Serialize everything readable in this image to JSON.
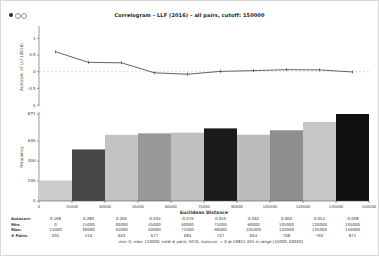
{
  "window": {
    "title": "Correlogram – LLF (2016) – all pairs, cutoff: 150000",
    "controls": {
      "close": "close-dot",
      "minimize": "minimize-dot",
      "zoom": "zoom-dot"
    }
  },
  "chart_data": [
    {
      "type": "line",
      "name": "autocorrelation-by-distance",
      "ylabel": "Autocorr. of LLF (2016)",
      "x": [
        7500,
        22500,
        37500,
        52500,
        67500,
        82500,
        97500,
        112500,
        127500,
        142500
      ],
      "values": [
        0.598,
        0.28,
        0.266,
        -0.034,
        -0.076,
        0.01,
        0.032,
        0.06,
        0.054,
        -0.008
      ],
      "yticks": [
        "1",
        "0.5",
        "0",
        "-0.5",
        "-1"
      ],
      "ytick_values": [
        1,
        0.5,
        0,
        -0.5,
        -1
      ],
      "ylim": [
        -1,
        1
      ],
      "zero_line": "dashed",
      "line_color": "#3a3a3a",
      "zero_line_color": "#c8c8c8"
    },
    {
      "type": "bar",
      "name": "pair-frequency-histogram",
      "ylabel": "Frequency",
      "xlabel": "Euclidean Distance",
      "categories": [
        "0-15000",
        "15000-30000",
        "30000-45000",
        "45000-60000",
        "60000-75000",
        "75000-90000",
        "90000-105000",
        "105000-120000",
        "120000-135000",
        "135000-150000"
      ],
      "values": [
        205,
        516,
        663,
        677,
        684,
        727,
        664,
        708,
        792,
        871
      ],
      "bar_colors": [
        "#cbcbcb",
        "#474747",
        "#c3c3c3",
        "#989898",
        "#c0c0c0",
        "#1b1b1b",
        "#bcbcbc",
        "#8e8e8e",
        "#c6c6c6",
        "#101010"
      ],
      "yticks": [
        "0",
        "200",
        "400",
        "600",
        "871"
      ],
      "ytick_values": [
        0,
        200,
        400,
        600,
        871
      ],
      "xticks": [
        "0",
        "15000",
        "30000",
        "45000",
        "60000",
        "75000",
        "90000",
        "105000",
        "120000",
        "135000",
        "150000"
      ],
      "xtick_values": [
        0,
        15000,
        30000,
        45000,
        60000,
        75000,
        90000,
        105000,
        120000,
        135000,
        150000
      ],
      "xlim": [
        0,
        150000
      ],
      "ylim": [
        0,
        871
      ]
    }
  ],
  "table": {
    "rows": [
      {
        "label": "Autocorr.",
        "values": [
          "0.598",
          "0.280",
          "0.266",
          "-0.034",
          "-0.076",
          "0.010",
          "0.032",
          "0.060",
          "0.054",
          "-0.008"
        ]
      },
      {
        "label": "Min:",
        "values": [
          "0",
          "15000",
          "30000",
          "45000",
          "60000",
          "75000",
          "90000",
          "105000",
          "120000",
          "135000"
        ]
      },
      {
        "label": "Max:",
        "values": [
          "15000",
          "30000",
          "45000",
          "60000",
          "75000",
          "90000",
          "105000",
          "120000",
          "135000",
          "150000"
        ]
      },
      {
        "label": "# Pairs:",
        "values": [
          "205",
          "516",
          "663",
          "677",
          "684",
          "727",
          "664",
          "708",
          "792",
          "871"
        ]
      }
    ]
  },
  "footnote": "min: 0, max: 150000, total # pairs: 5076, Autocorr. = 0 at 50851.405 in range [45000, 60000]",
  "colors": {
    "axis": "#555555",
    "tick_text": "#333333",
    "title_text": "#222222"
  }
}
